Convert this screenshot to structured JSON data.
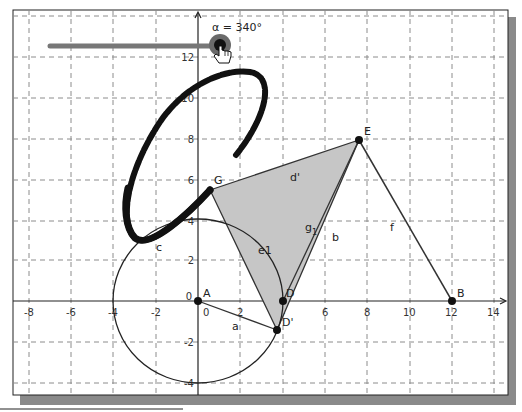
{
  "slider": {
    "label": "α = 340°",
    "value_deg": 340
  },
  "axes": {
    "x_ticks": [
      "-8",
      "-6",
      "-4",
      "-2",
      "0",
      "2",
      "4",
      "6",
      "8",
      "10",
      "12",
      "14"
    ],
    "y_ticks": [
      "-4",
      "-2",
      "0",
      "2",
      "4",
      "6",
      "8",
      "10",
      "12"
    ],
    "origin_label": "0"
  },
  "points": {
    "A": "A",
    "B": "B",
    "D": "D",
    "D_prime": "D'",
    "E": "E",
    "G": "G"
  },
  "segment_labels": {
    "a": "a",
    "b": "b",
    "f": "f",
    "c": "c",
    "e1": "e1",
    "g1": "g",
    "g1_sub": "1",
    "d_prime": "d'"
  },
  "colors": {
    "grid": "#888888",
    "polygon_fill": "#c8c8c8",
    "trace": "#111111",
    "slider_track": "#777777",
    "slider_handle": "#444444",
    "frame_shadow": "#808080"
  }
}
